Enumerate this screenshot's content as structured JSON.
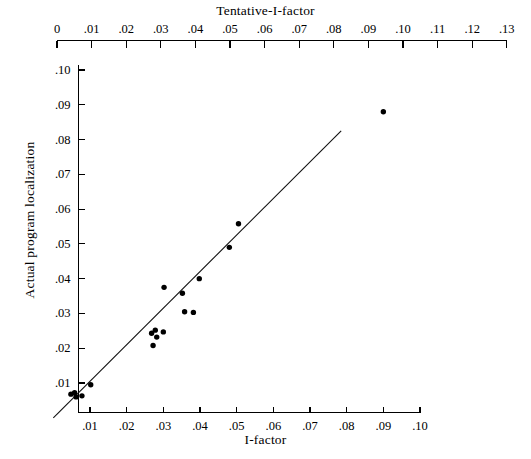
{
  "chart_data": {
    "type": "scatter",
    "title": "Tentative-I-factor",
    "xlabel": "I-factor",
    "ylabel": "Actual program localization",
    "grid": false,
    "legend": null,
    "top_axis": {
      "label": "Tentative-I-factor",
      "ticks": [
        0,
        0.01,
        0.02,
        0.03,
        0.04,
        0.05,
        0.06,
        0.07,
        0.08,
        0.09,
        0.1,
        0.11,
        0.12,
        0.13
      ],
      "tick_labels": [
        "0",
        ".01",
        ".02",
        ".03",
        ".04",
        ".05",
        ".06",
        ".07",
        ".08",
        ".09",
        ".10",
        ".11",
        ".12",
        ".13"
      ],
      "range": [
        0,
        0.13
      ]
    },
    "xaxis": {
      "label": "I-factor",
      "ticks": [
        0.01,
        0.02,
        0.03,
        0.04,
        0.05,
        0.06,
        0.07,
        0.08,
        0.09,
        0.1
      ],
      "tick_labels": [
        ".01",
        ".02",
        ".03",
        ".04",
        ".05",
        ".06",
        ".07",
        ".08",
        ".09",
        ".10"
      ],
      "xlim": [
        0.0,
        0.104
      ]
    },
    "yaxis": {
      "label": "Actual program localization",
      "ticks": [
        0.01,
        0.02,
        0.03,
        0.04,
        0.05,
        0.06,
        0.07,
        0.08,
        0.09,
        0.1
      ],
      "tick_labels": [
        ".01",
        ".02",
        ".03",
        ".04",
        ".05",
        ".06",
        ".07",
        ".08",
        ".09",
        ".10"
      ],
      "ylim": [
        0.0,
        0.103
      ]
    },
    "points": [
      {
        "x": 0.0048,
        "y": 0.0068
      },
      {
        "x": 0.0058,
        "y": 0.0072
      },
      {
        "x": 0.0062,
        "y": 0.006
      },
      {
        "x": 0.0078,
        "y": 0.0063
      },
      {
        "x": 0.0102,
        "y": 0.0095
      },
      {
        "x": 0.0268,
        "y": 0.0243
      },
      {
        "x": 0.0278,
        "y": 0.0252
      },
      {
        "x": 0.0282,
        "y": 0.0232
      },
      {
        "x": 0.0272,
        "y": 0.0208
      },
      {
        "x": 0.03,
        "y": 0.0247
      },
      {
        "x": 0.0302,
        "y": 0.0375
      },
      {
        "x": 0.0352,
        "y": 0.0358
      },
      {
        "x": 0.0358,
        "y": 0.0305
      },
      {
        "x": 0.0382,
        "y": 0.0303
      },
      {
        "x": 0.0398,
        "y": 0.04
      },
      {
        "x": 0.048,
        "y": 0.049
      },
      {
        "x": 0.0505,
        "y": 0.0558
      },
      {
        "x": 0.09,
        "y": 0.088
      }
    ],
    "fit_line": {
      "x0": 0.0,
      "y0": 0.0,
      "x1": 0.0785,
      "y1": 0.0825
    }
  }
}
